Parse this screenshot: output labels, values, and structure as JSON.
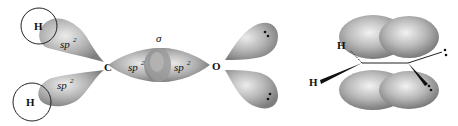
{
  "diagram": {
    "left_panel": {
      "title": "sigma-bond framework of formaldehyde (H2C=O)",
      "atoms": {
        "h_top": "H",
        "h_bottom": "H",
        "carbon": "C",
        "oxygen": "O"
      },
      "orbital_labels": {
        "ch_top": {
          "base": "sp",
          "sup": "2"
        },
        "ch_bottom": {
          "base": "sp",
          "sup": "2"
        },
        "co_carbon": {
          "base": "sp",
          "sup": "2"
        },
        "co_oxygen": {
          "base": "sp",
          "sup": "2"
        }
      },
      "bond_label": "σ",
      "lone_pair_symbol": "••"
    },
    "right_panel": {
      "title": "pi-bond of formaldehyde",
      "atoms": {
        "h_back": "H",
        "h_front": "H"
      },
      "lone_pair_symbol": "••"
    },
    "colors": {
      "lobe_light": "#e2e2e2",
      "lobe_dark": "#8a8a8a",
      "outline": "#222222",
      "text": "#111111"
    }
  }
}
